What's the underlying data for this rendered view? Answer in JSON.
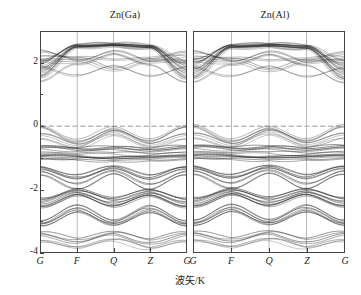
{
  "figure": {
    "axis_labels": {
      "y": "能量/eV",
      "x": "波矢/K"
    },
    "y_ticks": [
      "2",
      "0",
      "-2",
      "-4"
    ],
    "y_tick_values": [
      2,
      0,
      -2,
      -4
    ],
    "panels": [
      {
        "title": "Zn(Ga)",
        "x_ticks": [
          "G",
          "F",
          "Q",
          "Z",
          "G"
        ]
      },
      {
        "title": "Zn(Al)",
        "x_ticks": [
          "G",
          "F",
          "Q",
          "Z",
          "G"
        ]
      }
    ],
    "colors": {
      "band_line": "#2b2b2b",
      "frame": "#444444",
      "fermi_line": "#b9b9b9",
      "gridline": "#8a8a8a",
      "background": "#ffffff"
    }
  },
  "chart_data": {
    "type": "line",
    "title": "",
    "subtitle": "",
    "xlabel": "波矢/K",
    "ylabel": "能量/eV",
    "ylim": [
      -4,
      3
    ],
    "xlim": [
      0,
      4
    ],
    "grid": "vertical-highsymmetry-only",
    "legend": "none",
    "annotations": [
      {
        "text": "Fermi level",
        "y": 0,
        "style": "dashed-grey-horizontal"
      }
    ],
    "panels": [
      {
        "name": "Zn(Ga)",
        "x_categories": [
          "G",
          "F",
          "Q",
          "Z",
          "G"
        ],
        "x_positions": [
          0,
          1,
          2,
          3,
          4
        ],
        "series": [
          {
            "name": "c1",
            "values": [
              1.55,
              2.48,
              2.52,
              2.46,
              1.5
            ]
          },
          {
            "name": "c2",
            "values": [
              1.62,
              2.5,
              2.55,
              2.48,
              1.58
            ]
          },
          {
            "name": "c3",
            "values": [
              1.7,
              2.52,
              2.56,
              2.5,
              1.66
            ]
          },
          {
            "name": "c4",
            "values": [
              1.78,
              2.53,
              2.57,
              2.51,
              1.74
            ]
          },
          {
            "name": "c5",
            "values": [
              1.86,
              2.54,
              2.58,
              2.52,
              1.82
            ]
          },
          {
            "name": "c6",
            "values": [
              1.94,
              2.55,
              2.58,
              2.53,
              1.9
            ]
          },
          {
            "name": "c7",
            "values": [
              2.02,
              2.56,
              2.59,
              2.54,
              1.98
            ]
          },
          {
            "name": "c8",
            "values": [
              2.1,
              2.56,
              2.59,
              2.54,
              2.06
            ]
          },
          {
            "name": "c9",
            "values": [
              2.22,
              2.18,
              2.1,
              2.16,
              2.2
            ]
          },
          {
            "name": "c10",
            "values": [
              2.05,
              2.02,
              2.32,
              2.0,
              2.02
            ]
          },
          {
            "name": "c11",
            "values": [
              1.88,
              1.6,
              1.9,
              1.58,
              1.86
            ]
          },
          {
            "name": "c12",
            "values": [
              1.42,
              1.96,
              2.28,
              1.94,
              1.4
            ]
          },
          {
            "name": "c13",
            "values": [
              2.34,
              2.08,
              1.76,
              2.06,
              2.3
            ]
          },
          {
            "name": "v0",
            "values": [
              -0.02,
              -0.45,
              -0.05,
              -0.44,
              -0.02
            ]
          },
          {
            "name": "v0b",
            "values": [
              -0.05,
              -0.52,
              -0.12,
              -0.5,
              -0.05
            ]
          },
          {
            "name": "v0c",
            "values": [
              -0.3,
              -0.62,
              -0.2,
              -0.6,
              -0.3
            ]
          },
          {
            "name": "v0d",
            "values": [
              -0.42,
              -0.7,
              -0.3,
              -0.68,
              -0.42
            ]
          },
          {
            "name": "v1",
            "values": [
              -0.66,
              -0.72,
              -0.68,
              -0.74,
              -0.66
            ]
          },
          {
            "name": "v2",
            "values": [
              -0.72,
              -0.8,
              -0.74,
              -0.82,
              -0.72
            ]
          },
          {
            "name": "v3",
            "values": [
              -0.86,
              -0.9,
              -0.88,
              -0.92,
              -0.86
            ]
          },
          {
            "name": "v4",
            "values": [
              -0.94,
              -0.96,
              -1.0,
              -0.98,
              -0.94
            ]
          },
          {
            "name": "v5",
            "values": [
              -1.0,
              -1.02,
              -1.06,
              -1.04,
              -1.0
            ]
          },
          {
            "name": "v6",
            "values": [
              -1.06,
              -1.08,
              -1.12,
              -1.1,
              -1.06
            ]
          },
          {
            "name": "v7",
            "values": [
              -1.3,
              -1.55,
              -1.28,
              -1.56,
              -1.3
            ]
          },
          {
            "name": "v8",
            "values": [
              -1.38,
              -1.68,
              -1.36,
              -1.7,
              -1.38
            ]
          },
          {
            "name": "v9",
            "values": [
              -1.46,
              -1.84,
              -1.44,
              -1.86,
              -1.46
            ]
          },
          {
            "name": "v10",
            "values": [
              -1.56,
              -2.0,
              -1.52,
              -2.02,
              -1.56
            ]
          },
          {
            "name": "v11",
            "values": [
              -2.34,
              -2.04,
              -2.32,
              -2.06,
              -2.34
            ]
          },
          {
            "name": "v12",
            "values": [
              -2.42,
              -2.1,
              -2.4,
              -2.12,
              -2.42
            ]
          },
          {
            "name": "v13",
            "values": [
              -2.52,
              -2.16,
              -2.5,
              -2.18,
              -2.52
            ]
          },
          {
            "name": "v14",
            "values": [
              -2.6,
              -2.22,
              -2.58,
              -2.24,
              -2.6
            ]
          },
          {
            "name": "v15",
            "values": [
              -3.02,
              -2.52,
              -3.0,
              -2.54,
              -3.02
            ]
          },
          {
            "name": "v16",
            "values": [
              -3.1,
              -2.62,
              -3.08,
              -2.64,
              -3.1
            ]
          },
          {
            "name": "v17",
            "values": [
              -3.18,
              -2.74,
              -3.16,
              -2.76,
              -3.18
            ]
          },
          {
            "name": "v18",
            "values": [
              -3.4,
              -3.6,
              -3.38,
              -3.62,
              -3.4
            ]
          },
          {
            "name": "v19",
            "values": [
              -3.48,
              -3.72,
              -3.46,
              -3.74,
              -3.48
            ]
          },
          {
            "name": "v20",
            "values": [
              -3.7,
              -3.9,
              -3.66,
              -3.92,
              -3.7
            ]
          }
        ]
      },
      {
        "name": "Zn(Al)",
        "x_categories": [
          "G",
          "F",
          "Q",
          "Z",
          "G"
        ],
        "x_positions": [
          0,
          1,
          2,
          3,
          4
        ],
        "series": [
          {
            "name": "c1",
            "values": [
              1.52,
              2.46,
              2.5,
              2.44,
              1.48
            ]
          },
          {
            "name": "c2",
            "values": [
              1.6,
              2.49,
              2.53,
              2.46,
              1.56
            ]
          },
          {
            "name": "c3",
            "values": [
              1.68,
              2.51,
              2.55,
              2.48,
              1.64
            ]
          },
          {
            "name": "c4",
            "values": [
              1.76,
              2.52,
              2.56,
              2.5,
              1.72
            ]
          },
          {
            "name": "c5",
            "values": [
              1.84,
              2.53,
              2.57,
              2.51,
              1.8
            ]
          },
          {
            "name": "c6",
            "values": [
              1.92,
              2.54,
              2.58,
              2.52,
              1.88
            ]
          },
          {
            "name": "c7",
            "values": [
              2.0,
              2.55,
              2.58,
              2.53,
              1.96
            ]
          },
          {
            "name": "c8",
            "values": [
              2.12,
              2.56,
              2.59,
              2.54,
              2.08
            ]
          },
          {
            "name": "c9",
            "values": [
              2.2,
              2.16,
              2.08,
              2.14,
              2.18
            ]
          },
          {
            "name": "c10",
            "values": [
              2.06,
              2.0,
              2.3,
              1.98,
              2.04
            ]
          },
          {
            "name": "c11",
            "values": [
              1.86,
              1.58,
              1.88,
              1.56,
              1.84
            ]
          },
          {
            "name": "c12",
            "values": [
              1.4,
              1.94,
              2.26,
              1.92,
              1.38
            ]
          },
          {
            "name": "c13",
            "values": [
              2.32,
              2.06,
              1.74,
              2.04,
              2.28
            ]
          },
          {
            "name": "v0",
            "values": [
              0.02,
              -0.44,
              -0.04,
              -0.43,
              0.02
            ]
          },
          {
            "name": "v0b",
            "values": [
              -0.04,
              -0.5,
              -0.1,
              -0.49,
              -0.04
            ]
          },
          {
            "name": "v0c",
            "values": [
              -0.28,
              -0.6,
              -0.18,
              -0.58,
              -0.28
            ]
          },
          {
            "name": "v0d",
            "values": [
              -0.4,
              -0.68,
              -0.28,
              -0.66,
              -0.4
            ]
          },
          {
            "name": "v1",
            "values": [
              -0.64,
              -0.7,
              -0.66,
              -0.72,
              -0.64
            ]
          },
          {
            "name": "v2",
            "values": [
              -0.7,
              -0.78,
              -0.72,
              -0.8,
              -0.7
            ]
          },
          {
            "name": "v3",
            "values": [
              -0.84,
              -0.88,
              -0.86,
              -0.9,
              -0.84
            ]
          },
          {
            "name": "v4",
            "values": [
              -0.92,
              -0.94,
              -0.98,
              -0.96,
              -0.92
            ]
          },
          {
            "name": "v5",
            "values": [
              -0.98,
              -1.0,
              -1.04,
              -1.02,
              -0.98
            ]
          },
          {
            "name": "v6",
            "values": [
              -1.04,
              -1.06,
              -1.1,
              -1.08,
              -1.04
            ]
          },
          {
            "name": "v7",
            "values": [
              -1.28,
              -1.54,
              -1.26,
              -1.55,
              -1.28
            ]
          },
          {
            "name": "v8",
            "values": [
              -1.36,
              -1.66,
              -1.34,
              -1.68,
              -1.36
            ]
          },
          {
            "name": "v9",
            "values": [
              -1.44,
              -1.82,
              -1.42,
              -1.84,
              -1.44
            ]
          },
          {
            "name": "v10",
            "values": [
              -1.54,
              -1.98,
              -1.5,
              -2.0,
              -1.54
            ]
          },
          {
            "name": "v11",
            "values": [
              -2.32,
              -2.02,
              -2.3,
              -2.04,
              -2.32
            ]
          },
          {
            "name": "v12",
            "values": [
              -2.4,
              -2.08,
              -2.38,
              -2.1,
              -2.4
            ]
          },
          {
            "name": "v13",
            "values": [
              -2.5,
              -2.14,
              -2.48,
              -2.16,
              -2.5
            ]
          },
          {
            "name": "v14",
            "values": [
              -2.58,
              -2.2,
              -2.56,
              -2.22,
              -2.58
            ]
          },
          {
            "name": "v15",
            "values": [
              -3.0,
              -2.5,
              -2.98,
              -2.52,
              -3.0
            ]
          },
          {
            "name": "v16",
            "values": [
              -3.08,
              -2.6,
              -3.06,
              -2.62,
              -3.08
            ]
          },
          {
            "name": "v17",
            "values": [
              -3.16,
              -2.72,
              -3.14,
              -2.74,
              -3.16
            ]
          },
          {
            "name": "v18",
            "values": [
              -3.38,
              -3.58,
              -3.36,
              -3.6,
              -3.38
            ]
          },
          {
            "name": "v19",
            "values": [
              -3.46,
              -3.7,
              -3.44,
              -3.72,
              -3.46
            ]
          },
          {
            "name": "v20",
            "values": [
              -3.68,
              -3.88,
              -3.64,
              -3.9,
              -3.68
            ]
          }
        ]
      }
    ]
  }
}
